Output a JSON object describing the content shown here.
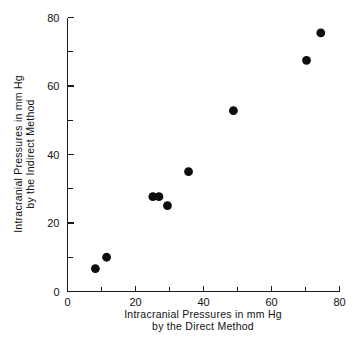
{
  "chart_data": {
    "type": "scatter",
    "title": "",
    "xlabel": "Intracranial Pressures in mm Hg by the Direct Method",
    "xlabel_line1": "Intracranial  Pressures  in  mm Hg",
    "xlabel_line2": "by  the  Direct  Method",
    "ylabel": "Intracranial Pressures in mm Hg by the Indirect Method",
    "ylabel_line1": "Intracranial  Pressures  in  mm Hg",
    "ylabel_line2": "by  the  Indirect  Method",
    "xlim": [
      0,
      80
    ],
    "ylim": [
      0,
      80
    ],
    "xticks": [
      0,
      20,
      40,
      60,
      80
    ],
    "yticks": [
      0,
      20,
      40,
      60,
      80
    ],
    "xtick_labels": [
      "0",
      "20",
      "40",
      "60",
      "80"
    ],
    "ytick_labels": [
      "0",
      "20",
      "40",
      "60",
      "80"
    ],
    "minor_tick_step": 10,
    "grid": false,
    "legend": false,
    "tick_direction": "in",
    "marker": "filled-circle",
    "marker_color": "#0d0d0d",
    "marker_size": 4.4,
    "points": [
      {
        "x": 8.2,
        "y": 6.7
      },
      {
        "x": 11.5,
        "y": 10.0
      },
      {
        "x": 25.1,
        "y": 27.7
      },
      {
        "x": 26.9,
        "y": 27.7
      },
      {
        "x": 29.4,
        "y": 25.1
      },
      {
        "x": 35.6,
        "y": 35.0
      },
      {
        "x": 48.8,
        "y": 52.8
      },
      {
        "x": 70.3,
        "y": 67.5
      },
      {
        "x": 74.5,
        "y": 75.5
      }
    ]
  }
}
